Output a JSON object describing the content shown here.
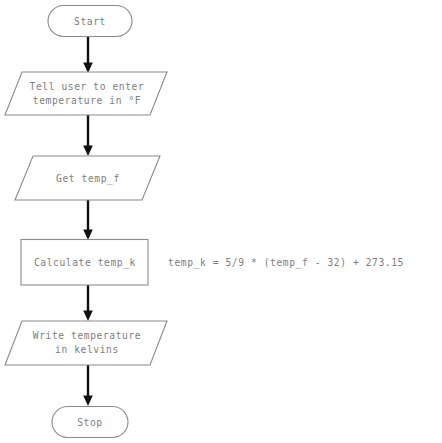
{
  "diagram": {
    "background_color": "#ffffff",
    "shape_stroke_color": "#8a8a8a",
    "text_color": "#7d7d7d",
    "arrow_color": "#111111",
    "nodes": [
      {
        "id": "start",
        "shape": "terminator",
        "label": "Start",
        "lines": [
          "Start"
        ]
      },
      {
        "id": "prompt",
        "shape": "parallelogram",
        "label": "Tell user to enter temperature in °F",
        "lines": [
          "Tell user to enter",
          "temperature in °F"
        ]
      },
      {
        "id": "input",
        "shape": "parallelogram",
        "label": "Get temp_f",
        "lines": [
          "Get temp_f"
        ]
      },
      {
        "id": "calculate",
        "shape": "process",
        "label": "Calculate temp_k",
        "lines": [
          "Calculate temp_k"
        ]
      },
      {
        "id": "output",
        "shape": "parallelogram",
        "label": "Write temperature in kelvins",
        "lines": [
          "Write temperature",
          "in kelvins"
        ]
      },
      {
        "id": "stop",
        "shape": "terminator",
        "label": "Stop",
        "lines": [
          "Stop"
        ]
      }
    ],
    "annotations": [
      {
        "id": "formula",
        "attached_to": "calculate",
        "text": "temp_k = 5/9 * (temp_f - 32) + 273.15"
      }
    ],
    "connectors": [
      {
        "id": "start-to-prompt",
        "from": "start",
        "to": "prompt"
      },
      {
        "id": "prompt-to-input",
        "from": "prompt",
        "to": "input"
      },
      {
        "id": "input-to-calculate",
        "from": "input",
        "to": "calculate"
      },
      {
        "id": "calculate-to-output",
        "from": "calculate",
        "to": "output"
      },
      {
        "id": "output-to-stop",
        "from": "output",
        "to": "stop"
      }
    ]
  }
}
